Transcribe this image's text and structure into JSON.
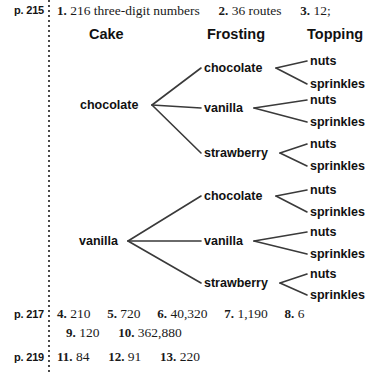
{
  "sections": [
    {
      "page_label": "p. 215",
      "answers": [
        {
          "num": "1.",
          "value": "216 three-digit numbers"
        },
        {
          "num": "2.",
          "value": "36 routes"
        },
        {
          "num": "3.",
          "value": "12;"
        }
      ]
    },
    {
      "page_label": "p. 217",
      "answers": [
        {
          "num": "4.",
          "value": "210"
        },
        {
          "num": "5.",
          "value": "720"
        },
        {
          "num": "6.",
          "value": "40,320"
        },
        {
          "num": "7.",
          "value": "1,190"
        },
        {
          "num": "8.",
          "value": "6"
        },
        {
          "num": "9.",
          "value": "120"
        },
        {
          "num": "10.",
          "value": "362,880"
        }
      ]
    },
    {
      "page_label": "p. 219",
      "answers": [
        {
          "num": "11.",
          "value": "84"
        },
        {
          "num": "12.",
          "value": "91"
        },
        {
          "num": "13.",
          "value": "220"
        }
      ]
    }
  ],
  "diagram": {
    "headers": [
      {
        "label": "Cake"
      },
      {
        "label": "Frosting"
      },
      {
        "label": "Topping"
      }
    ],
    "cakes": [
      {
        "label": "chocolate"
      },
      {
        "label": "vanilla"
      }
    ],
    "frostings": [
      {
        "label": "chocolate"
      },
      {
        "label": "vanilla"
      },
      {
        "label": "strawberry"
      }
    ],
    "toppings": [
      {
        "label": "nuts"
      },
      {
        "label": "sprinkles"
      }
    ],
    "line_color": "#3a3a3a"
  },
  "flat": {
    "h0": "Cake",
    "h1": "Frosting",
    "h2": "Topping",
    "p215": "p. 215",
    "p217": "p. 217",
    "p219": "p. 219",
    "a1n": "1.",
    "a1v": "216 three-digit numbers",
    "a2n": "2.",
    "a2v": "36 routes",
    "a3n": "3.",
    "a3v": "12;",
    "a4n": "4.",
    "a4v": "210",
    "a5n": "5.",
    "a5v": "720",
    "a6n": "6.",
    "a6v": "40,320",
    "a7n": "7.",
    "a7v": "1,190",
    "a8n": "8.",
    "a8v": "6",
    "a9n": "9.",
    "a9v": "120",
    "a10n": "10.",
    "a10v": "362,880",
    "a11n": "11.",
    "a11v": "84",
    "a12n": "12.",
    "a12v": "91",
    "a13n": "13.",
    "a13v": "220",
    "t1_cake": "chocolate",
    "t1_f1": "chocolate",
    "t1_f2": "vanilla",
    "t1_f3": "strawberry",
    "t1_f1_t1": "nuts",
    "t1_f1_t2": "sprinkles",
    "t1_f2_t1": "nuts",
    "t1_f2_t2": "sprinkles",
    "t1_f3_t1": "nuts",
    "t1_f3_t2": "sprinkles",
    "t2_cake": "vanilla",
    "t2_f1": "chocolate",
    "t2_f2": "vanilla",
    "t2_f3": "strawberry",
    "t2_f1_t1": "nuts",
    "t2_f1_t2": "sprinkles",
    "t2_f2_t1": "nuts",
    "t2_f2_t2": "sprinkles",
    "t2_f3_t1": "nuts",
    "t2_f3_t2": "sprinkles"
  }
}
